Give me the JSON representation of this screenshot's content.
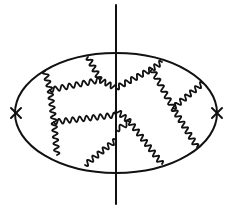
{
  "diagram": {
    "type": "feynman-diagram",
    "colors": {
      "ink": "#111111",
      "background": "#ffffff"
    },
    "fermion_loop": {
      "cx": 116,
      "cy": 113,
      "rx": 101,
      "ry": 60
    },
    "cut_line": {
      "x": 116,
      "y1": 5,
      "y2": 204
    },
    "vertices": [
      {
        "name": "left-insertion",
        "x": 16,
        "y": 113,
        "symbol": "cross"
      },
      {
        "name": "right-insertion",
        "x": 217,
        "y": 113,
        "symbol": "cross"
      }
    ],
    "wavy_lines": [
      {
        "x1": 88,
        "y1": 57,
        "x2": 100,
        "y2": 80
      },
      {
        "x1": 45,
        "y1": 71,
        "x2": 50,
        "y2": 90
      },
      {
        "x1": 50,
        "y1": 90,
        "x2": 100,
        "y2": 80
      },
      {
        "x1": 100,
        "y1": 80,
        "x2": 116,
        "y2": 88
      },
      {
        "x1": 50,
        "y1": 90,
        "x2": 54,
        "y2": 122
      },
      {
        "x1": 54,
        "y1": 122,
        "x2": 116,
        "y2": 115
      },
      {
        "x1": 54,
        "y1": 122,
        "x2": 57,
        "y2": 155
      },
      {
        "x1": 85,
        "y1": 165,
        "x2": 116,
        "y2": 140
      },
      {
        "x1": 116,
        "y1": 88,
        "x2": 152,
        "y2": 69
      },
      {
        "x1": 152,
        "y1": 69,
        "x2": 162,
        "y2": 62
      },
      {
        "x1": 152,
        "y1": 69,
        "x2": 173,
        "y2": 108
      },
      {
        "x1": 173,
        "y1": 108,
        "x2": 203,
        "y2": 83
      },
      {
        "x1": 173,
        "y1": 108,
        "x2": 197,
        "y2": 147
      },
      {
        "x1": 116,
        "y1": 110,
        "x2": 130,
        "y2": 122
      },
      {
        "x1": 130,
        "y1": 122,
        "x2": 162,
        "y2": 164
      },
      {
        "x1": 116,
        "y1": 130,
        "x2": 130,
        "y2": 122
      }
    ]
  }
}
